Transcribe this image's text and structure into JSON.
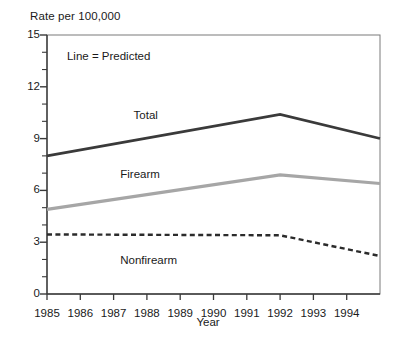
{
  "chart_data": {
    "type": "line",
    "title": "",
    "ylabel": "Rate per 100,000",
    "xlabel": "Year",
    "x": [
      1985,
      1986,
      1987,
      1988,
      1989,
      1990,
      1991,
      1992,
      1993,
      1994,
      1995
    ],
    "xtick_labels": [
      "1985",
      "1986",
      "1987",
      "1988",
      "1989",
      "1990",
      "1991",
      "1992",
      "1993",
      "1994"
    ],
    "xlim": [
      1985,
      1995
    ],
    "ylim": [
      0,
      15
    ],
    "ytick_labels": [
      "0",
      "3",
      "6",
      "9",
      "12",
      "15"
    ],
    "ytick_values": [
      0,
      3,
      6,
      9,
      12,
      15
    ],
    "yminor_step": 1,
    "grid": false,
    "legend": "none",
    "annotations": [
      {
        "text": "Line = Predicted",
        "x": 1985.6,
        "y": 13.7
      },
      {
        "text": "Total",
        "x": 1987.6,
        "y": 10.3
      },
      {
        "text": "Firearm",
        "x": 1987.2,
        "y": 6.9
      },
      {
        "text": "Nonfirearm",
        "x": 1987.2,
        "y": 1.9
      }
    ],
    "series": [
      {
        "name": "Total",
        "style": "solid",
        "color": "#3a3a3a",
        "width": 2.6,
        "x": [
          1985,
          1992,
          1995
        ],
        "values": [
          8.0,
          10.4,
          9.0
        ]
      },
      {
        "name": "Firearm",
        "style": "solid",
        "color": "#a6a6a6",
        "width": 3.2,
        "x": [
          1985,
          1992,
          1995
        ],
        "values": [
          4.9,
          6.9,
          6.4
        ]
      },
      {
        "name": "Nonfirearm",
        "style": "dashed",
        "color": "#2b2b2b",
        "width": 2.4,
        "x": [
          1985,
          1992,
          1995
        ],
        "values": [
          3.45,
          3.4,
          2.2
        ]
      }
    ]
  }
}
